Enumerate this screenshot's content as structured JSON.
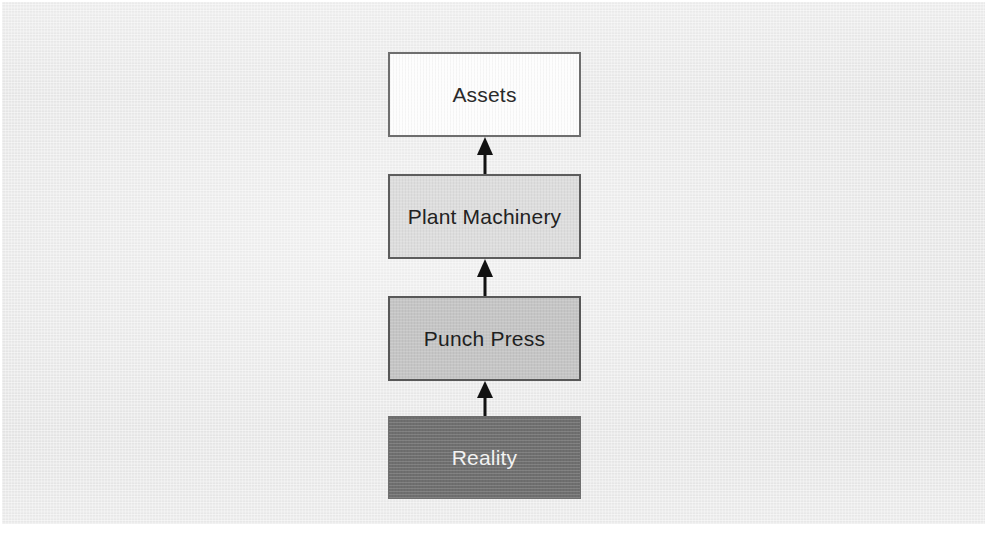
{
  "diagram": {
    "type": "vertical-flow",
    "title": "",
    "direction": "bottom-to-top",
    "background_color": "#e6e6e6",
    "nodes": [
      {
        "id": "assets",
        "label": "Assets",
        "level": 4,
        "fill": "#fdfdfd",
        "border": "#6e6e6e",
        "text_color": "#2a2a2a"
      },
      {
        "id": "plant-machinery",
        "label": "Plant Machinery",
        "level": 3,
        "fill": "#dddddd",
        "border": "#5d5d5d",
        "text_color": "#222222"
      },
      {
        "id": "punch-press",
        "label": "Punch Press",
        "level": 2,
        "fill": "#c5c5c5",
        "border": "#585858",
        "text_color": "#1f1f1f"
      },
      {
        "id": "reality",
        "label": "Reality",
        "level": 1,
        "fill": "#6f6f6f",
        "border": "#6f6f6f",
        "text_color": "#f2f2f2"
      }
    ],
    "edges": [
      {
        "id": "edge-reality-to-punch-press",
        "from": "reality",
        "to": "punch-press",
        "arrowhead": "solid-triangle",
        "color": "#111111"
      },
      {
        "id": "edge-punch-press-to-plant-machinery",
        "from": "punch-press",
        "to": "plant-machinery",
        "arrowhead": "solid-triangle",
        "color": "#111111"
      },
      {
        "id": "edge-plant-machinery-to-assets",
        "from": "plant-machinery",
        "to": "assets",
        "arrowhead": "solid-triangle",
        "color": "#111111"
      }
    ]
  }
}
